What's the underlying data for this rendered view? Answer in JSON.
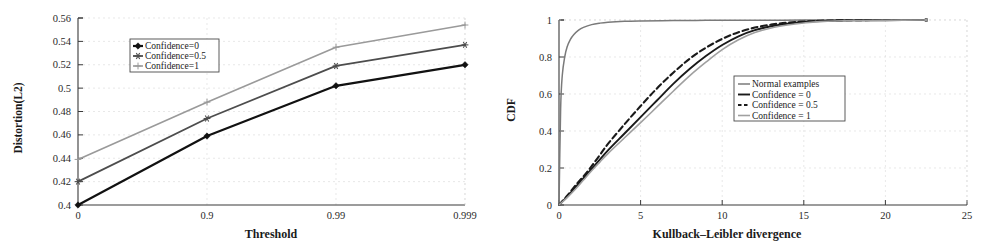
{
  "chart_data": [
    {
      "type": "line",
      "title": "",
      "panel": "left",
      "xlabel": "Threshold",
      "ylabel": "Distortion(L2)",
      "categories": [
        "0",
        "0.9",
        "0.99",
        "0.999"
      ],
      "xtick_labels": [
        "0",
        "0.9",
        "0.99",
        "0.999"
      ],
      "ytick_labels": [
        "0.4",
        "0.42",
        "0.44",
        "0.46",
        "0.48",
        "0.5",
        "0.52",
        "0.54",
        "0.56"
      ],
      "ylim": [
        0.4,
        0.56
      ],
      "ytick_step": 0.02,
      "grid": true,
      "legend_position": "upper-left-inset",
      "series": [
        {
          "name": "Confidence=0",
          "values": [
            0.4,
            0.459,
            0.502,
            0.52
          ],
          "color": "#111111",
          "marker": "diamond",
          "width": 2.2
        },
        {
          "name": "Confidence=0.5",
          "values": [
            0.42,
            0.474,
            0.519,
            0.537
          ],
          "color": "#4d4d4d",
          "marker": "star",
          "width": 1.8
        },
        {
          "name": "Confidence=1",
          "values": [
            0.439,
            0.488,
            0.535,
            0.554
          ],
          "color": "#9a9a9a",
          "marker": "plus",
          "width": 1.6
        }
      ]
    },
    {
      "type": "line",
      "title": "",
      "panel": "right",
      "xlabel": "Kullback–Leibler divergence",
      "ylabel": "CDF",
      "xtick_labels": [
        "0",
        "5",
        "10",
        "15",
        "20",
        "25"
      ],
      "ytick_labels": [
        "0",
        "0.2",
        "0.4",
        "0.6",
        "0.8",
        "1"
      ],
      "xlim": [
        0,
        25
      ],
      "ylim": [
        0,
        1
      ],
      "xtick_step": 5,
      "ytick_step": 0.2,
      "grid": true,
      "legend_position": "center-right-inset",
      "series": [
        {
          "name": "Normal examples",
          "color": "#7a7a7a",
          "style": "solid",
          "width": 1.5,
          "x": [
            0,
            0.1,
            0.2,
            0.35,
            0.5,
            0.7,
            0.9,
            1.2,
            1.5,
            2.0,
            2.5,
            3.0,
            4.0,
            5.0,
            7.0,
            9.0,
            11.0,
            13.0,
            15.0,
            18.0,
            20.0,
            22.5
          ],
          "y": [
            0.0,
            0.52,
            0.7,
            0.8,
            0.855,
            0.895,
            0.92,
            0.945,
            0.96,
            0.975,
            0.983,
            0.988,
            0.993,
            0.995,
            0.997,
            0.998,
            0.999,
            0.999,
            1.0,
            1.0,
            1.0,
            1.0
          ]
        },
        {
          "name": "Confidence = 0",
          "color": "#1a1a1a",
          "style": "solid",
          "width": 1.9,
          "x": [
            0,
            0.5,
            1.0,
            1.5,
            2.0,
            2.5,
            3.0,
            4.0,
            5.0,
            6.0,
            7.0,
            8.0,
            9.0,
            10.0,
            11.0,
            12.0,
            13.0,
            14.0,
            15.0,
            16.0,
            18.0,
            20.0,
            22.5
          ],
          "y": [
            0.0,
            0.045,
            0.095,
            0.145,
            0.195,
            0.245,
            0.295,
            0.385,
            0.475,
            0.565,
            0.655,
            0.735,
            0.805,
            0.865,
            0.912,
            0.945,
            0.966,
            0.98,
            0.989,
            0.994,
            0.998,
            0.999,
            1.0
          ]
        },
        {
          "name": "Confidence = 0.5",
          "color": "#1a1a1a",
          "style": "dashed",
          "width": 2.1,
          "x": [
            0,
            0.5,
            1.0,
            1.5,
            2.0,
            2.5,
            3.0,
            4.0,
            5.0,
            6.0,
            7.0,
            8.0,
            9.0,
            10.0,
            11.0,
            12.0,
            13.0,
            14.0,
            15.0,
            16.0,
            18.0,
            20.0,
            22.5
          ],
          "y": [
            0.0,
            0.05,
            0.105,
            0.155,
            0.21,
            0.27,
            0.33,
            0.435,
            0.535,
            0.63,
            0.715,
            0.79,
            0.85,
            0.898,
            0.934,
            0.959,
            0.975,
            0.986,
            0.992,
            0.996,
            0.999,
            1.0,
            1.0
          ]
        },
        {
          "name": "Confidence = 1",
          "color": "#a0a0a0",
          "style": "solid",
          "width": 1.6,
          "x": [
            0,
            0.5,
            1.0,
            1.5,
            2.0,
            2.5,
            3.0,
            4.0,
            5.0,
            6.0,
            7.0,
            8.0,
            9.0,
            10.0,
            11.0,
            12.0,
            13.0,
            14.0,
            15.0,
            16.0,
            18.0,
            20.0,
            22.5
          ],
          "y": [
            0.0,
            0.04,
            0.085,
            0.135,
            0.185,
            0.232,
            0.278,
            0.362,
            0.445,
            0.53,
            0.615,
            0.698,
            0.772,
            0.84,
            0.893,
            0.932,
            0.957,
            0.973,
            0.984,
            0.991,
            0.997,
            0.999,
            1.0
          ]
        }
      ]
    }
  ]
}
